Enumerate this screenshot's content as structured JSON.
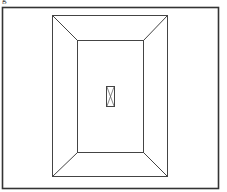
{
  "figure": {
    "caption_fragment": "g",
    "colors": {
      "line": "#333333",
      "background": "#ffffff"
    }
  }
}
